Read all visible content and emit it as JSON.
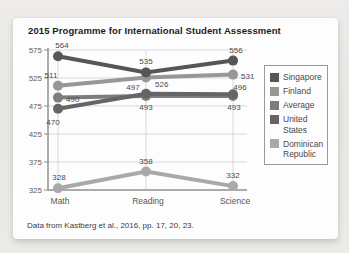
{
  "title": "2015 Programme for International Student Assessment",
  "caption": "Data from Kastberg et al., 2016, pp. 17, 20, 23.",
  "colors": {
    "card_bg": "#fdfdfd",
    "grid": "#d9d9d9",
    "axis": "#8f8f8f",
    "tick_label": "#5f5f5f",
    "value_label": "#4a4a4a",
    "category_label": "#565656"
  },
  "chart_data": {
    "type": "line",
    "title": "2015 Programme for International Student Assessment",
    "categories": [
      "Math",
      "Reading",
      "Science"
    ],
    "series": [
      {
        "name": "Singapore",
        "values": [
          564,
          535,
          556
        ],
        "color": "#565656"
      },
      {
        "name": "Finland",
        "values": [
          511,
          526,
          531
        ],
        "color": "#979797"
      },
      {
        "name": "Average",
        "values": [
          490,
          493,
          493
        ],
        "color": "#7d7d7d"
      },
      {
        "name": "United States",
        "values": [
          470,
          497,
          496
        ],
        "color": "#656565"
      },
      {
        "name": "Dominican Republic",
        "values": [
          328,
          358,
          332
        ],
        "color": "#a9a9a9"
      }
    ],
    "yticks": [
      575,
      525,
      475,
      425,
      375,
      325
    ],
    "ylim": [
      325,
      575
    ],
    "grid": true,
    "legend_position": "right",
    "point_labels_shown": true,
    "source_note": "Data from Kastberg et al., 2016, pp. 17, 20, 23."
  }
}
